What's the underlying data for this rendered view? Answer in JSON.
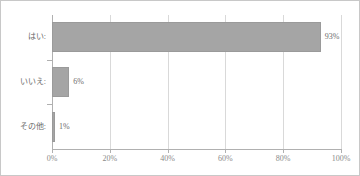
{
  "chart_data": {
    "type": "bar",
    "orientation": "horizontal",
    "title": "",
    "xlabel": "",
    "ylabel": "",
    "categories": [
      "はい:",
      "いいえ:",
      "その他:"
    ],
    "values": [
      93,
      6,
      1
    ],
    "value_labels": [
      "93%",
      "6%",
      "1%"
    ],
    "xlim": [
      0,
      100
    ],
    "xticks": [
      0,
      20,
      40,
      60,
      80,
      100
    ],
    "xtick_labels": [
      "0%",
      "20%",
      "40%",
      "60%",
      "80%",
      "100%"
    ],
    "grid": true,
    "grid_axis": "x",
    "legend": false,
    "series": [
      {
        "name": "",
        "values": [
          93,
          6,
          1
        ]
      }
    ],
    "colors": {
      "bar_fill": "#a5a5a5",
      "bar_edge": "#9a9a9a",
      "gridline": "#d9d9d9",
      "axis": "#b0b0b0",
      "label_text": "#6b6b6b",
      "tick_text": "#8a8a8a",
      "frame_border": "#c8c8c8",
      "background": "#ffffff"
    }
  }
}
